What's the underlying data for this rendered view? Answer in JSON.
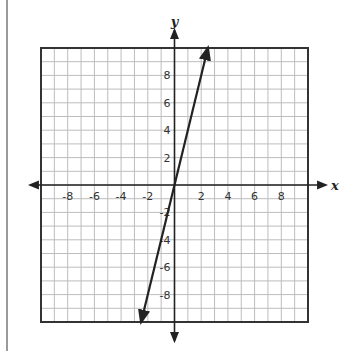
{
  "chart_data": {
    "type": "line",
    "title": "",
    "xlabel": "x",
    "ylabel": "y",
    "xlim": [
      -10,
      10
    ],
    "ylim": [
      -10,
      10
    ],
    "grid": true,
    "grid_step": 1,
    "x_tick_labels": [
      "-8",
      "-6",
      "-4",
      "-2",
      "2",
      "4",
      "6",
      "8"
    ],
    "y_tick_labels": [
      "8",
      "6",
      "4",
      "2",
      "-2",
      "-4",
      "-6",
      "-8"
    ],
    "series": [
      {
        "name": "line",
        "equation": "y = 4x",
        "slope": 4,
        "intercept": 0,
        "x": [
          -2.5,
          0,
          2.5
        ],
        "y": [
          -10,
          0,
          10
        ],
        "arrows_both_ends": true
      }
    ],
    "legend": null
  },
  "colors": {
    "grid": "#bdbdbd",
    "border": "#333333",
    "axis": "#222222",
    "line": "#222222",
    "left_rule": "#9a9a9a"
  },
  "labels": {
    "x_axis": "x",
    "y_axis": "y"
  }
}
